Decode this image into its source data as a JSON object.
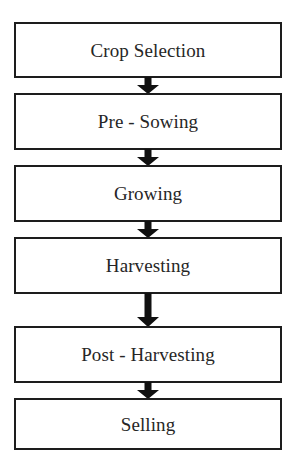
{
  "diagram": {
    "type": "linear-flowchart",
    "orientation": "vertical-top-to-bottom",
    "background_color": "#ffffff",
    "box_border_color": "#1d1d1d",
    "box_fill_color": "#ffffff",
    "text_color": "#262626",
    "arrow_color": "#111111",
    "nodes": [
      {
        "id": "crop-selection",
        "label": "Crop Selection",
        "order": 1
      },
      {
        "id": "pre-sowing",
        "label": "Pre - Sowing",
        "order": 2
      },
      {
        "id": "growing",
        "label": "Growing",
        "order": 3
      },
      {
        "id": "harvesting",
        "label": "Harvesting",
        "order": 4
      },
      {
        "id": "post-harvesting",
        "label": "Post - Harvesting",
        "order": 5
      },
      {
        "id": "selling",
        "label": "Selling",
        "order": 6
      }
    ],
    "connectors": [
      {
        "id": "arrow-1",
        "from": "crop-selection",
        "to": "pre-sowing",
        "glyph": "down-arrow-icon"
      },
      {
        "id": "arrow-2",
        "from": "pre-sowing",
        "to": "growing",
        "glyph": "down-arrow-icon"
      },
      {
        "id": "arrow-3",
        "from": "growing",
        "to": "harvesting",
        "glyph": "down-arrow-icon"
      },
      {
        "id": "arrow-4",
        "from": "harvesting",
        "to": "post-harvesting",
        "glyph": "down-arrow-icon"
      },
      {
        "id": "arrow-5",
        "from": "post-harvesting",
        "to": "selling",
        "glyph": "down-arrow-icon"
      }
    ]
  }
}
